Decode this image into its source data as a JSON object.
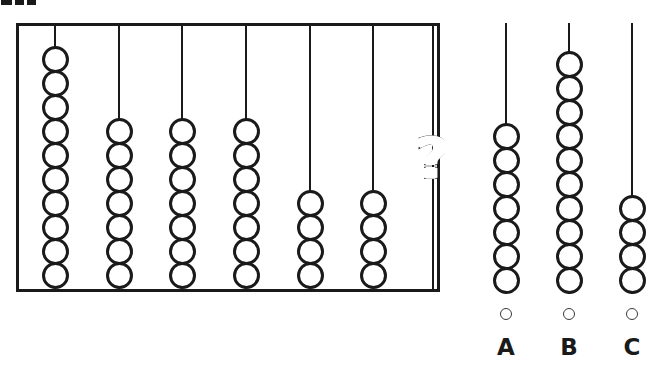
{
  "puzzle": {
    "type": "abacus-sequence-pattern",
    "prompt_fragment": "",
    "question_symbol": "?"
  },
  "abacus": {
    "name": "abacus-frame",
    "rod_count": 7,
    "rods": [
      {
        "id": "rod-1",
        "bead_count": 10,
        "x": 36,
        "unknown": false
      },
      {
        "id": "rod-2",
        "bead_count": 7,
        "x": 100,
        "unknown": false
      },
      {
        "id": "rod-3",
        "bead_count": 7,
        "x": 163,
        "unknown": false
      },
      {
        "id": "rod-4",
        "bead_count": 7,
        "x": 227,
        "unknown": false
      },
      {
        "id": "rod-5",
        "bead_count": 4,
        "x": 291,
        "unknown": false
      },
      {
        "id": "rod-6",
        "bead_count": 4,
        "x": 354,
        "unknown": false
      },
      {
        "id": "rod-7",
        "bead_count": 0,
        "x": 414,
        "unknown": true
      }
    ]
  },
  "options": [
    {
      "id": "option-a",
      "label": "A",
      "bead_count": 7,
      "x": 0,
      "selected": false
    },
    {
      "id": "option-b",
      "label": "B",
      "bead_count": 10,
      "x": 63,
      "selected": false
    },
    {
      "id": "option-c",
      "label": "C",
      "bead_count": 4,
      "x": 126,
      "selected": false
    }
  ],
  "chart_data": {
    "type": "bar",
    "title": "",
    "xlabel": "",
    "ylabel": "Beads per rod",
    "categories": [
      "1",
      "2",
      "3",
      "4",
      "5",
      "6",
      "7"
    ],
    "values": [
      10,
      7,
      7,
      7,
      4,
      4,
      null
    ],
    "ylim": [
      0,
      10
    ],
    "grid": false,
    "legend": null,
    "annotations": [
      "rod 7 value is unknown, marked with a question mark"
    ],
    "answer_choices": {
      "A": 7,
      "B": 10,
      "C": 4
    }
  },
  "colors": {
    "ink": "#1a1a1a",
    "paper": "#ffffff",
    "radio_stroke": "#3a3a3a"
  }
}
